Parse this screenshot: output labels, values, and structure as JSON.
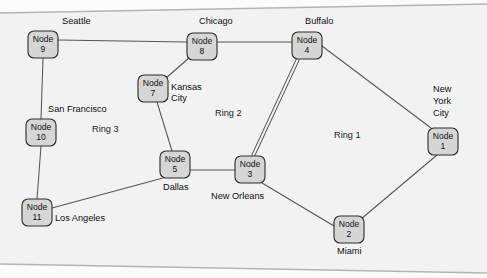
{
  "figure": {
    "background_color": "#ffffff",
    "node_fill_color": "#d6d6d6",
    "node_stroke_color": "#2b2b2b",
    "link_color": "#555555",
    "frame_color": "#b4b4b4"
  },
  "nodes": [
    {
      "id": "1",
      "label_line1": "Node",
      "label_line2": "1",
      "city": "New York City",
      "city_lines": [
        "New",
        "York",
        "City"
      ],
      "x": 428,
      "y": 128,
      "w": 30,
      "h": 27
    },
    {
      "id": "2",
      "label_line1": "Node",
      "label_line2": "2",
      "city": "Miami",
      "city_lines": [
        "Miami"
      ],
      "x": 334,
      "y": 216,
      "w": 30,
      "h": 27
    },
    {
      "id": "3",
      "label_line1": "Node",
      "label_line2": "3",
      "city": "New Orleans",
      "city_lines": [
        "New Orleans"
      ],
      "x": 235,
      "y": 156,
      "w": 30,
      "h": 27
    },
    {
      "id": "4",
      "label_line1": "Node",
      "label_line2": "4",
      "city": "Buffalo",
      "city_lines": [
        "Buffalo"
      ],
      "x": 292,
      "y": 32,
      "w": 30,
      "h": 27
    },
    {
      "id": "5",
      "label_line1": "Node",
      "label_line2": "5",
      "city": "Dallas",
      "city_lines": [
        "Dallas"
      ],
      "x": 160,
      "y": 151,
      "w": 30,
      "h": 27
    },
    {
      "id": "7",
      "label_line1": "Node",
      "label_line2": "7",
      "city": "Kansas City",
      "city_lines": [
        "Kansas",
        "City"
      ],
      "x": 138,
      "y": 75,
      "w": 30,
      "h": 27
    },
    {
      "id": "8",
      "label_line1": "Node",
      "label_line2": "8",
      "city": "Chicago",
      "city_lines": [
        "Chicago"
      ],
      "x": 187,
      "y": 33,
      "w": 30,
      "h": 27
    },
    {
      "id": "9",
      "label_line1": "Node",
      "label_line2": "9",
      "city": "Seattle",
      "city_lines": [
        "Seattle"
      ],
      "x": 28,
      "y": 31,
      "w": 30,
      "h": 27
    },
    {
      "id": "10",
      "label_line1": "Node",
      "label_line2": "10",
      "city": "San Francisco",
      "city_lines": [
        "San Francisco"
      ],
      "x": 26,
      "y": 119,
      "w": 30,
      "h": 27
    },
    {
      "id": "11",
      "label_line1": "Node",
      "label_line2": "11",
      "city": "Los Angeles",
      "city_lines": [
        "Los Angeles"
      ],
      "x": 22,
      "y": 199,
      "w": 30,
      "h": 27
    }
  ],
  "city_labels": [
    {
      "name": "seattle",
      "text": "Seattle",
      "x": 62,
      "y": 24
    },
    {
      "name": "chicago",
      "text": "Chicago",
      "x": 199,
      "y": 24
    },
    {
      "name": "buffalo",
      "text": "Buffalo",
      "x": 305,
      "y": 24
    },
    {
      "name": "kansas-city-1",
      "text": "Kansas",
      "x": 171,
      "y": 90
    },
    {
      "name": "kansas-city-2",
      "text": "City",
      "x": 171,
      "y": 101
    },
    {
      "name": "san-francisco",
      "text": "San Francisco",
      "x": 48,
      "y": 112
    },
    {
      "name": "new-york-1",
      "text": "New",
      "x": 433,
      "y": 92
    },
    {
      "name": "new-york-2",
      "text": "York",
      "x": 433,
      "y": 104
    },
    {
      "name": "new-york-3",
      "text": "City",
      "x": 433,
      "y": 116
    },
    {
      "name": "dallas",
      "text": "Dallas",
      "x": 163,
      "y": 190
    },
    {
      "name": "new-orleans",
      "text": "New Orleans",
      "x": 211,
      "y": 199
    },
    {
      "name": "los-angeles",
      "text": "Los Angeles",
      "x": 55,
      "y": 221
    },
    {
      "name": "miami",
      "text": "Miami",
      "x": 337,
      "y": 254
    }
  ],
  "ring_labels": [
    {
      "name": "ring-1",
      "text": "Ring 1",
      "x": 334,
      "y": 138
    },
    {
      "name": "ring-2",
      "text": "Ring 2",
      "x": 215,
      "y": 116
    },
    {
      "name": "ring-3",
      "text": "Ring 3",
      "x": 92,
      "y": 132
    }
  ],
  "links": [
    {
      "name": "link-node9-node8",
      "from": "9",
      "to": "8",
      "type": "single",
      "x1": 58,
      "y1": 40,
      "x2": 187,
      "y2": 42
    },
    {
      "name": "link-node8-node4",
      "from": "8",
      "to": "4",
      "type": "single",
      "x1": 217,
      "y1": 42,
      "x2": 292,
      "y2": 42
    },
    {
      "name": "link-node8-node7",
      "from": "8",
      "to": "7",
      "type": "single",
      "x1": 189,
      "y1": 58,
      "x2": 166,
      "y2": 78
    },
    {
      "name": "link-node9-node10",
      "from": "9",
      "to": "10",
      "type": "single",
      "x1": 43,
      "y1": 58,
      "x2": 41,
      "y2": 119
    },
    {
      "name": "link-node7-node5",
      "from": "7",
      "to": "5",
      "type": "single",
      "x1": 157,
      "y1": 102,
      "x2": 172,
      "y2": 151
    },
    {
      "name": "link-node10-node11",
      "from": "10",
      "to": "11",
      "type": "single",
      "x1": 41,
      "y1": 146,
      "x2": 37,
      "y2": 199
    },
    {
      "name": "link-node11-node5",
      "from": "11",
      "to": "5",
      "type": "single",
      "x1": 52,
      "y1": 208,
      "x2": 163,
      "y2": 178
    },
    {
      "name": "link-node5-node3",
      "from": "5",
      "to": "3",
      "type": "single",
      "x1": 190,
      "y1": 170,
      "x2": 235,
      "y2": 170
    },
    {
      "name": "link-node4-node3",
      "from": "4",
      "to": "3",
      "type": "double",
      "x1": 298,
      "y1": 59,
      "x2": 253,
      "y2": 156
    },
    {
      "name": "link-node4-node1",
      "from": "4",
      "to": "1",
      "type": "single",
      "x1": 322,
      "y1": 46,
      "x2": 431,
      "y2": 128
    },
    {
      "name": "link-node3-node2",
      "from": "3",
      "to": "2",
      "type": "single",
      "x1": 262,
      "y1": 183,
      "x2": 334,
      "y2": 226
    },
    {
      "name": "link-node2-node1",
      "from": "2",
      "to": "1",
      "type": "single",
      "x1": 361,
      "y1": 219,
      "x2": 437,
      "y2": 155
    }
  ],
  "frame": {
    "top_line": {
      "x1": 0,
      "y1": 13,
      "x2": 487,
      "y2": 4
    },
    "bottom_line": {
      "x1": 0,
      "y1": 264,
      "x2": 487,
      "y2": 273
    }
  }
}
